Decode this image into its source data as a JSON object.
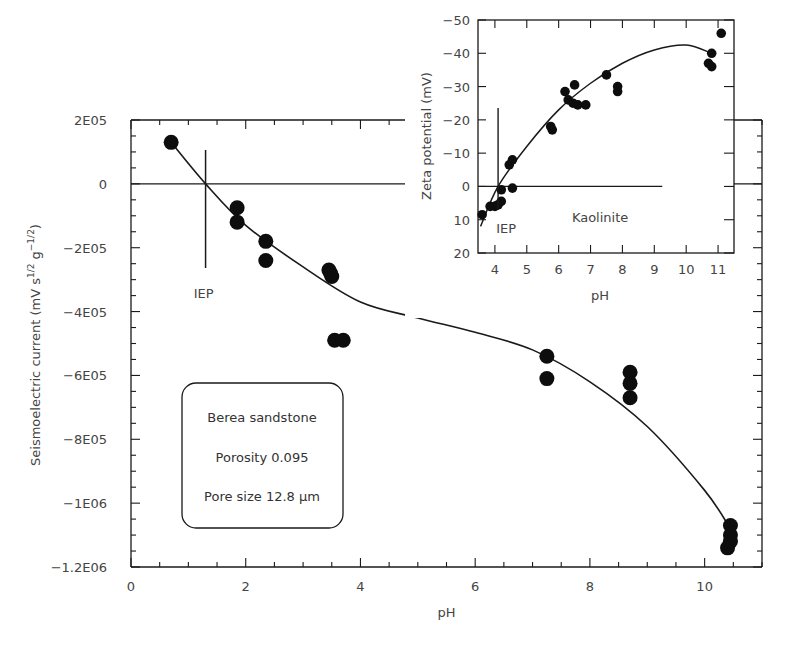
{
  "chart_data": [
    {
      "type": "scatter",
      "name": "main",
      "title": "",
      "xlabel": "pH",
      "ylabel": "Seismoelectric current (mV s^1/2 g^-1/2)",
      "ylabel_main": "Seismoelectric current (mV s",
      "ylabel_sup1": "1/2",
      "ylabel_mid": " g",
      "ylabel_sup2": "−1/2",
      "ylabel_end": ")",
      "xlim": [
        0,
        11
      ],
      "ylim": [
        -1200000,
        200000
      ],
      "xticks": [
        0,
        2,
        4,
        6,
        8,
        10
      ],
      "xtick_labels": [
        "0",
        "2",
        "4",
        "6",
        "8",
        "10"
      ],
      "yticks": [
        200000,
        0,
        -200000,
        -400000,
        -600000,
        -800000,
        -1000000,
        -1200000
      ],
      "ytick_labels": [
        "2E05",
        "0",
        "−2E05",
        "−4E05",
        "−6E05",
        "−8E05",
        "−1E06",
        "−1.2E06"
      ],
      "grid": false,
      "annotations": [
        {
          "text": "IEP",
          "x": 1.3,
          "y": 0
        }
      ],
      "legend_box": [
        "Berea sandstone",
        "Porosity 0.095",
        "Pore size 12.8 µm"
      ],
      "series": [
        {
          "name": "measurements",
          "x": [
            0.7,
            1.85,
            1.85,
            2.35,
            2.35,
            3.45,
            3.5,
            3.48,
            3.55,
            3.7,
            7.25,
            7.25,
            8.7,
            8.7,
            8.7,
            10.45,
            10.45,
            10.45,
            10.4
          ],
          "y": [
            130000,
            -75000,
            -120000,
            -180000,
            -240000,
            -270000,
            -290000,
            -280000,
            -490000,
            -490000,
            -540000,
            -610000,
            -590000,
            -625000,
            -670000,
            -1070000,
            -1100000,
            -1120000,
            -1140000
          ]
        },
        {
          "name": "fit",
          "x": [
            0.7,
            1.3,
            2,
            3,
            4,
            5,
            6,
            7,
            8,
            9,
            10,
            10.45
          ],
          "y": [
            130000,
            0,
            -130000,
            -260000,
            -370000,
            -420000,
            -465000,
            -520000,
            -620000,
            -760000,
            -960000,
            -1080000
          ]
        }
      ]
    },
    {
      "type": "scatter",
      "name": "inset",
      "title": "Kaolinite",
      "xlabel": "pH",
      "ylabel": "Zeta potential (mV)",
      "xlim": [
        3.47,
        11.5
      ],
      "ylim": [
        20,
        -50
      ],
      "xticks": [
        4,
        5,
        6,
        7,
        8,
        9,
        10,
        11
      ],
      "xtick_labels": [
        "4",
        "5",
        "6",
        "7",
        "8",
        "9",
        "10",
        "11"
      ],
      "yticks": [
        -50,
        -40,
        -30,
        -20,
        -10,
        0,
        10,
        20
      ],
      "ytick_labels": [
        "−50",
        "−40",
        "−30",
        "−20",
        "−10",
        "0",
        "10",
        "20"
      ],
      "grid": false,
      "annotations": [
        {
          "text": "IEP",
          "x": 4.1,
          "y": 0
        },
        {
          "text": "Kaolinite",
          "x": 7.3,
          "y": 10
        }
      ],
      "series": [
        {
          "name": "measurements",
          "x": [
            3.6,
            3.85,
            4.0,
            4.1,
            4.2,
            4.2,
            4.45,
            4.55,
            4.55,
            5.75,
            5.8,
            6.2,
            6.3,
            6.45,
            6.5,
            6.6,
            6.85,
            7.5,
            7.85,
            7.85,
            10.7,
            10.8,
            10.8,
            11.1
          ],
          "y": [
            8.5,
            6,
            6,
            5.5,
            4.5,
            1,
            -6.5,
            -8,
            0.5,
            -18,
            -17,
            -28.5,
            -26,
            -25,
            -30.5,
            -24.5,
            -24.5,
            -33.5,
            -30,
            -28.5,
            -37,
            -36,
            -40,
            -46
          ]
        },
        {
          "name": "fit",
          "x": [
            3.55,
            4.1,
            5,
            6,
            7,
            8,
            9,
            10,
            10.8
          ],
          "y": [
            12,
            0,
            -12,
            -23,
            -31,
            -37,
            -41,
            -42.5,
            -40
          ]
        }
      ]
    }
  ]
}
